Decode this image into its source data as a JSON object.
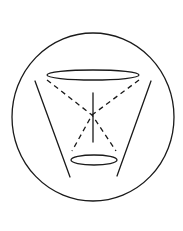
{
  "diagram": {
    "type": "geometric-line-drawing",
    "colors": {
      "background": "#ffffff",
      "stroke": "#1a1a1a"
    },
    "outer_circle": {
      "cx": 93,
      "cy": 117,
      "rx": 81,
      "ry": 84
    },
    "top_ellipse": {
      "cx": 93,
      "cy": 75,
      "rx": 46,
      "ry": 5
    },
    "bottom_ellipse": {
      "cx": 94,
      "cy": 160,
      "rx": 23,
      "ry": 5
    },
    "left_side_line": {
      "x1": 35,
      "y1": 81,
      "x2": 70,
      "y2": 177
    },
    "right_side_line": {
      "x1": 151,
      "y1": 81,
      "x2": 117,
      "y2": 176
    },
    "vertical_axis": {
      "x": 93,
      "y1": 93,
      "y2": 142
    },
    "crossing_point": {
      "x": 92,
      "y": 115
    },
    "dashed_lines": [
      {
        "from": [
          47,
          80
        ],
        "via": [
          92,
          115
        ],
        "to": [
          116,
          151
        ]
      },
      {
        "from": [
          139,
          80
        ],
        "via": [
          92,
          115
        ],
        "to": [
          72,
          151
        ]
      }
    ]
  }
}
